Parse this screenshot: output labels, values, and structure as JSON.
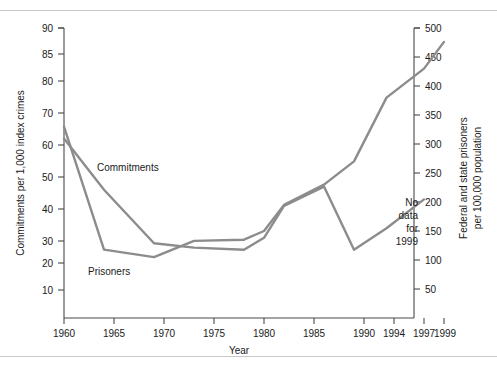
{
  "chart_data": {
    "type": "line",
    "title": "",
    "xlabel": "Year",
    "ylabel": "Commitments per 1,000 index crimes",
    "y2label": "Federal and state prisoners per 100,000 population",
    "grid": false,
    "legend_position": "inline-annotations",
    "x_ticks": [
      "1960",
      "1965",
      "1970",
      "1975",
      "1980",
      "1985",
      "1990",
      "1994",
      "1997",
      "1999"
    ],
    "y_left_ticks": [
      "10",
      "20",
      "30",
      "40",
      "50",
      "60",
      "70",
      "80",
      "85",
      "90"
    ],
    "y_right_ticks": [
      "50",
      "100",
      "150",
      "200",
      "250",
      "300",
      "350",
      "400",
      "450",
      "500"
    ],
    "ylim_left": [
      0,
      90
    ],
    "ylim_right": [
      0,
      500
    ],
    "annotations": [
      "No data for 1999"
    ],
    "series": [
      {
        "name": "Commitments",
        "axis": "left",
        "units": "commitments per 1,000 index crimes",
        "x": [
          1960,
          1964,
          1969,
          1973,
          1978,
          1980,
          1982,
          1986,
          1989,
          1993,
          1997
        ],
        "values": [
          62,
          46,
          29,
          27,
          26,
          31,
          41,
          47,
          26,
          34,
          43
        ]
      },
      {
        "name": "Prisoners",
        "axis": "right",
        "units": "federal and state prisoners per 100,000 population",
        "x": [
          1960,
          1964,
          1969,
          1973,
          1978,
          1980,
          1982,
          1986,
          1989,
          1993,
          1997,
          1999
        ],
        "values": [
          330,
          118,
          105,
          133,
          135,
          150,
          195,
          230,
          270,
          380,
          430,
          476
        ],
        "values_on_left_scale": [
          60,
          21.5,
          19,
          24,
          24.5,
          27,
          35,
          41.5,
          49,
          68.5,
          77.5,
          86.5
        ]
      }
    ]
  },
  "axes": {
    "left": {
      "title": "Commitments per 1,000 index crimes",
      "ticks": [
        {
          "label": "90",
          "y": 28
        },
        {
          "label": "85",
          "y": 54
        },
        {
          "label": "80",
          "y": 81
        },
        {
          "label": "70",
          "y": 113
        },
        {
          "label": "60",
          "y": 145
        },
        {
          "label": "50",
          "y": 177
        },
        {
          "label": "40",
          "y": 209
        },
        {
          "label": "30",
          "y": 241
        },
        {
          "label": "20",
          "y": 263
        },
        {
          "label": "10",
          "y": 290
        }
      ]
    },
    "right": {
      "title_line1": "Federal and state prisoners",
      "title_line2": "per 100,000 population",
      "ticks": [
        {
          "label": "500",
          "y": 28
        },
        {
          "label": "450",
          "y": 57
        },
        {
          "label": "400",
          "y": 86
        },
        {
          "label": "350",
          "y": 115
        },
        {
          "label": "300",
          "y": 144
        },
        {
          "label": "250",
          "y": 173
        },
        {
          "label": "200",
          "y": 202
        },
        {
          "label": "150",
          "y": 231
        },
        {
          "label": "100",
          "y": 260
        },
        {
          "label": "50",
          "y": 289
        }
      ]
    },
    "bottom": {
      "title": "Year",
      "ticks": [
        {
          "label": "1960",
          "x": 64
        },
        {
          "label": "1965",
          "x": 114
        },
        {
          "label": "1970",
          "x": 164
        },
        {
          "label": "1975",
          "x": 214
        },
        {
          "label": "1980",
          "x": 264
        },
        {
          "label": "1985",
          "x": 314
        },
        {
          "label": "1990",
          "x": 364
        },
        {
          "label": "1994",
          "x": 394
        },
        {
          "label": "1997",
          "x": 424
        },
        {
          "label": "1999",
          "x": 444
        }
      ]
    }
  },
  "series_labels": {
    "commitments": "Commitments",
    "prisoners": "Prisoners"
  },
  "note": {
    "line1": "No",
    "line2": "data",
    "line3": "for",
    "line4": "1999"
  },
  "colors": {
    "commitments_line": "#8c8c8c",
    "prisoners_line": "#8c8c8c",
    "axis": "#4a4a4a",
    "text": "#1a1a1a",
    "rule": "#c9c9c9",
    "background": "#ffffff"
  }
}
